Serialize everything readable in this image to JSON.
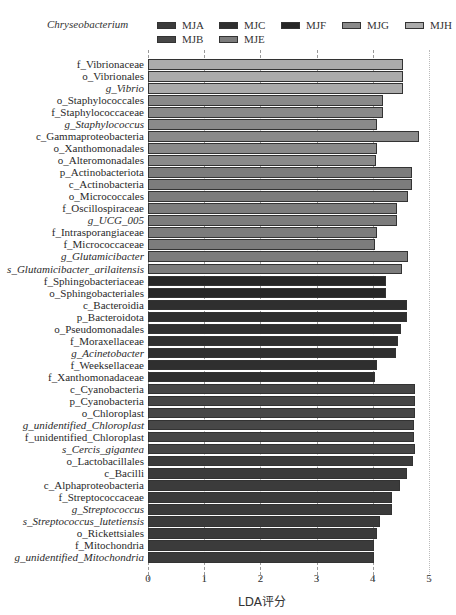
{
  "chart_data": {
    "type": "bar",
    "orientation": "horizontal",
    "title": "",
    "legend_title": "Chryseobacterium",
    "xlabel": "LDA评分",
    "ylabel": "",
    "xlim": [
      0,
      5
    ],
    "x_ticks": [
      "0",
      "1",
      "2",
      "3",
      "4",
      "5"
    ],
    "grid": "vertical dashed lines at each tick",
    "legend_position": "top",
    "legend": [
      {
        "name": "MJA",
        "color": "#3b3b3b"
      },
      {
        "name": "MJC",
        "color": "#2f2f2f"
      },
      {
        "name": "MJF",
        "color": "#262626"
      },
      {
        "name": "MJG",
        "color": "#8a8a8a"
      },
      {
        "name": "MJH",
        "color": "#ababab"
      },
      {
        "name": "MJB",
        "color": "#474747"
      },
      {
        "name": "MJE",
        "color": "#7c7c7c"
      }
    ],
    "categories": [
      "f_Vibrionaceae",
      "o_Vibrionales",
      "g_Vibrio",
      "o_Staphylococcales",
      "f_Staphylococcaceae",
      "g_Staphylococcus",
      "c_Gammaproteobacteria",
      "o_Xanthomonadales",
      "o_Alteromonadales",
      "p_Actinobacteriota",
      "c_Actinobacteria",
      "o_Micrococcales",
      "f_Oscillospiraceae",
      "g_UCG_005",
      "f_Intrasporangiaceae",
      "f_Micrococcaceae",
      "g_Glutamicibacter",
      "s_Glutamicibacter_arilaitensis",
      "f_Sphingobacteriaceae",
      "o_Sphingobacteriales",
      "c_Bacteroidia",
      "p_Bacteroidota",
      "o_Pseudomonadales",
      "f_Moraxellaceae",
      "g_Acinetobacter",
      "f_Weeksellaceae",
      "f_Xanthomonadaceae",
      "c_Cyanobacteria",
      "p_Cyanobacteria",
      "o_Chloroplast",
      "g_unidentified_Chloroplast",
      "f_unidentified_Chloroplast",
      "s_Cercis_gigantea",
      "o_Lactobacillales",
      "c_Bacilli",
      "c_Alphaproteobacteria",
      "f_Streptococcaceae",
      "g_Streptococcus",
      "s_Streptococcus_lutetiensis",
      "o_Rickettsiales",
      "f_Mitochondria",
      "g_unidentified_Mitochondria"
    ],
    "values": [
      4.54,
      4.54,
      4.54,
      4.19,
      4.19,
      4.08,
      4.82,
      4.07,
      4.05,
      4.7,
      4.7,
      4.63,
      4.43,
      4.43,
      4.08,
      4.04,
      4.63,
      4.52,
      4.23,
      4.23,
      4.6,
      4.6,
      4.5,
      4.45,
      4.41,
      4.07,
      4.04,
      4.75,
      4.75,
      4.75,
      4.73,
      4.74,
      4.75,
      4.71,
      4.6,
      4.48,
      4.35,
      4.35,
      4.12,
      4.07,
      4.03,
      4.02
    ],
    "groups": [
      "MJH",
      "MJH",
      "MJH",
      "MJG",
      "MJG",
      "MJG",
      "MJG",
      "MJG",
      "MJG",
      "MJE",
      "MJE",
      "MJE",
      "MJE",
      "MJE",
      "MJE",
      "MJE",
      "MJE",
      "MJE",
      "MJF",
      "MJF",
      "MJC",
      "MJC",
      "MJC",
      "MJC",
      "MJC",
      "MJC",
      "MJC",
      "MJB",
      "MJB",
      "MJB",
      "MJB",
      "MJB",
      "MJB",
      "MJA",
      "MJA",
      "MJA",
      "MJA",
      "MJA",
      "MJA",
      "MJA",
      "MJA",
      "MJA"
    ],
    "italic": [
      false,
      false,
      true,
      false,
      false,
      true,
      false,
      false,
      false,
      false,
      false,
      false,
      false,
      true,
      false,
      false,
      true,
      true,
      false,
      false,
      false,
      false,
      false,
      false,
      true,
      false,
      false,
      false,
      false,
      false,
      true,
      false,
      true,
      false,
      false,
      false,
      false,
      true,
      true,
      false,
      false,
      true
    ]
  }
}
